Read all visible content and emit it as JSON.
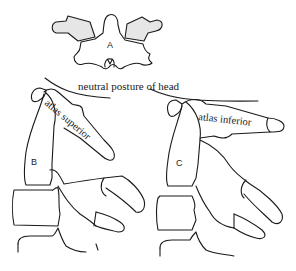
{
  "figure": {
    "panels": [
      {
        "id": "A",
        "label": "A",
        "description": "atlas vertebra, superior view"
      },
      {
        "id": "B",
        "label": "B",
        "annotation": "atlas superior"
      },
      {
        "id": "C",
        "label": "C",
        "annotation": "atlas inferior"
      }
    ],
    "caption": "neutral posture of head",
    "colors": {
      "line": "#1a1a1a",
      "shade": "#e6e6e6",
      "background": "#ffffff"
    }
  }
}
